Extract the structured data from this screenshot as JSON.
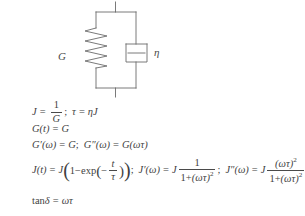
{
  "figure": {
    "model_name": "Kelvin-Voigt model",
    "diagram": {
      "spring_label": "G",
      "dashpot_label": "η",
      "elements": [
        "spring",
        "dashpot",
        "top-rail",
        "bottom-rail",
        "top-terminal",
        "bottom-terminal"
      ],
      "line_color": "#6b6b6b"
    },
    "equations": [
      {
        "id": "compliance-and-retardation-time",
        "text": "J = 1/G ;  τ = ηJ",
        "parts": {
          "lhs1": "J",
          "eq1": "=",
          "num1": "1",
          "den1": "G",
          "sep": ";",
          "lhs2": "τ",
          "eq2": "=",
          "rhs2": "ηJ"
        }
      },
      {
        "id": "relaxation-modulus",
        "text": "G(t) = G",
        "parts": {
          "lhs": "G",
          "arg": "(t)",
          "eq": "=",
          "rhs": "G"
        }
      },
      {
        "id": "dynamic-moduli",
        "text": "G′(ω) = G ; G″(ω) = G(ωτ)",
        "parts": {
          "lhs1": "G′(ω)",
          "eq1": "=",
          "rhs1": "G",
          "sep": ";",
          "lhs2": "G″(ω)",
          "eq2": "=",
          "rhs2": "G(ωτ)"
        }
      },
      {
        "id": "creep-compliance-and-dynamic-compliance",
        "text": "J(t) = J(1 - exp(-t/τ)) ;  J′(ω) = J · 1/(1+(ωτ)²) ;  J″(ω) = J · (ωτ)²/(1+(ωτ)²)",
        "parts": {
          "lhs1": "J",
          "arg1": "(t)",
          "eq1": "=",
          "coef1": "J",
          "one": "1",
          "minus": "−",
          "exp": "exp",
          "negsign": "−",
          "exp_num": "t",
          "exp_den": "τ",
          "sep1": ";",
          "lhs2": "J′(ω)",
          "eq2": "=",
          "coef2": "J",
          "f2_num": "1",
          "f2_den_a": "1",
          "f2_den_plus": "+",
          "f2_den_b": "(ωτ)",
          "f2_den_pow": "2",
          "sep2": ";",
          "lhs3": "J″(ω)",
          "eq3": "=",
          "coef3": "J",
          "f3_num_b": "(ωτ)",
          "f3_num_pow": "2",
          "f3_den_a": "1",
          "f3_den_plus": "+",
          "f3_den_b": "(ωτ)",
          "f3_den_pow": "2"
        }
      },
      {
        "id": "loss-tangent",
        "text": "tanδ = ωτ",
        "parts": {
          "tan": "tan",
          "delta": "δ",
          "eq": "=",
          "rhs": "ωτ"
        }
      }
    ]
  }
}
